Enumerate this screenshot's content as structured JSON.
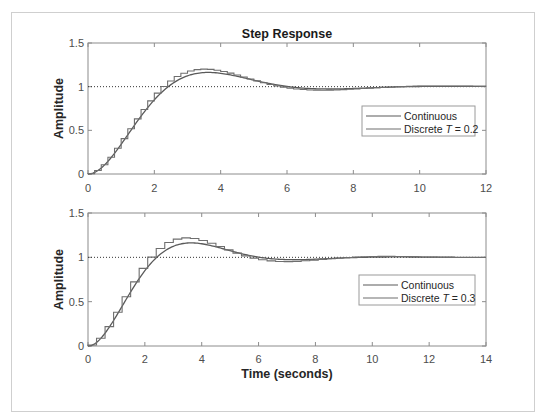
{
  "chart_data": [
    {
      "type": "line",
      "title": "Step Response",
      "xlabel": "",
      "ylabel": "Amplitude",
      "xlim": [
        0,
        12
      ],
      "ylim": [
        0,
        1.5
      ],
      "xticks": [
        "0",
        "2",
        "4",
        "6",
        "8",
        "10",
        "12"
      ],
      "yticks": [
        "0",
        "0.5",
        "1",
        "1.5"
      ],
      "grid": false,
      "reference_line": {
        "y": 1,
        "style": "dotted"
      },
      "legend": {
        "position": "right-middle",
        "entries": [
          "Continuous",
          "Discrete T = 0.2"
        ]
      },
      "series": [
        {
          "name": "Continuous",
          "style": "line",
          "zeta": 0.5,
          "wn": 1.0,
          "x": [
            0,
            0.5,
            1,
            1.5,
            2,
            2.5,
            3,
            3.63,
            4,
            5,
            6,
            7,
            7.26,
            8,
            9,
            10,
            11,
            12
          ],
          "values": [
            0,
            0.11,
            0.34,
            0.59,
            0.8,
            0.96,
            1.08,
            1.16,
            1.15,
            1.08,
            1.0,
            0.97,
            0.97,
            0.98,
            1.0,
            1.01,
            1.0,
            1.0
          ]
        },
        {
          "name": "Discrete T = 0.2",
          "style": "stairs",
          "T": 0.2,
          "zeta": 0.455,
          "wn": 1.0,
          "peak": 1.2,
          "peak_time": 3.6
        }
      ]
    },
    {
      "type": "line",
      "title": "",
      "xlabel": "Time (seconds)",
      "ylabel": "Amplitude",
      "xlim": [
        0,
        14
      ],
      "ylim": [
        0,
        1.5
      ],
      "xticks": [
        "0",
        "2",
        "4",
        "6",
        "8",
        "10",
        "12",
        "14"
      ],
      "yticks": [
        "0",
        "0.5",
        "1",
        "1.5"
      ],
      "grid": false,
      "reference_line": {
        "y": 1,
        "style": "dotted"
      },
      "legend": {
        "position": "right-middle",
        "entries": [
          "Continuous",
          "Discrete T = 0.3"
        ]
      },
      "series": [
        {
          "name": "Continuous",
          "style": "line",
          "zeta": 0.5,
          "wn": 1.0,
          "x": [
            0,
            0.5,
            1,
            1.5,
            2,
            2.5,
            3,
            3.63,
            4,
            5,
            6,
            7,
            7.26,
            8,
            9,
            10,
            11,
            12,
            13,
            14
          ],
          "values": [
            0,
            0.11,
            0.34,
            0.59,
            0.8,
            0.96,
            1.08,
            1.16,
            1.15,
            1.08,
            1.0,
            0.97,
            0.97,
            0.98,
            1.0,
            1.01,
            1.0,
            1.0,
            1.0,
            1.0
          ]
        },
        {
          "name": "Discrete T = 0.3",
          "style": "stairs",
          "T": 0.3,
          "zeta": 0.435,
          "wn": 1.0,
          "peak": 1.22,
          "peak_time": 3.6
        }
      ]
    }
  ],
  "plots": [
    {
      "title": "Step Response",
      "ylabel": "Amplitude",
      "xlabel": "",
      "xticks": [
        "0",
        "2",
        "4",
        "6",
        "8",
        "10",
        "12"
      ],
      "yticks": [
        "0",
        "0.5",
        "1",
        "1.5"
      ],
      "legend": {
        "continuous": "Continuous",
        "discrete_prefix": "Discrete ",
        "discrete_var": "T",
        "discrete_suffix": " = 0.2"
      }
    },
    {
      "title": "",
      "ylabel": "Amplitude",
      "xlabel": "Time (seconds)",
      "xticks": [
        "0",
        "2",
        "4",
        "6",
        "8",
        "10",
        "12",
        "14"
      ],
      "yticks": [
        "0",
        "0.5",
        "1",
        "1.5"
      ],
      "legend": {
        "continuous": "Continuous",
        "discrete_prefix": "Discrete ",
        "discrete_var": "T",
        "discrete_suffix": " = 0.3"
      }
    }
  ],
  "colors": {
    "line": "#5a5a5a",
    "stairs": "#6e6e6e",
    "axis": "#8c8c8c",
    "reference": "#333333",
    "legend_border": "#9a9a9a"
  }
}
